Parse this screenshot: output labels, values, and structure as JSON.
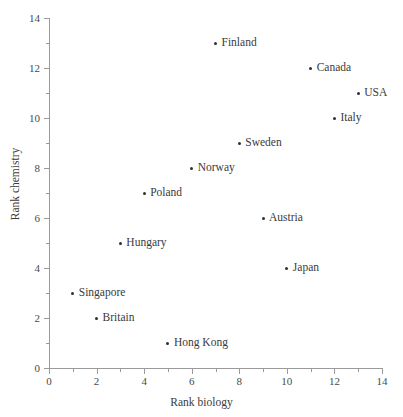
{
  "chart_data": {
    "type": "scatter",
    "title": "",
    "xlabel": "Rank biology",
    "ylabel": "Rank chemistry",
    "xlim": [
      0,
      14
    ],
    "ylim": [
      0,
      14
    ],
    "grid": false,
    "legend": "none",
    "x_ticks": [
      0,
      2,
      4,
      6,
      8,
      10,
      12,
      14
    ],
    "y_ticks": [
      0,
      2,
      4,
      6,
      8,
      10,
      12,
      14
    ],
    "x_minor_ticks": [
      1,
      3,
      5,
      7,
      9,
      11,
      13
    ],
    "y_minor_ticks": [
      1,
      3,
      5,
      7,
      9,
      11,
      13
    ],
    "x_tick_labels": [
      "0",
      "2",
      "4",
      "6",
      "8",
      "10",
      "12",
      "14"
    ],
    "y_tick_labels": [
      "0",
      "2",
      "4",
      "6",
      "8",
      "10",
      "12",
      "14"
    ],
    "marker_color": "#2f2f2f",
    "axis_color": "#9a9a9a",
    "points": [
      {
        "label": "Finland",
        "x": 7,
        "y": 13
      },
      {
        "label": "Canada",
        "x": 11,
        "y": 12
      },
      {
        "label": "USA",
        "x": 13,
        "y": 11
      },
      {
        "label": "Italy",
        "x": 12,
        "y": 10
      },
      {
        "label": "Sweden",
        "x": 8,
        "y": 9
      },
      {
        "label": "Norway",
        "x": 6,
        "y": 8
      },
      {
        "label": "Poland",
        "x": 4,
        "y": 7
      },
      {
        "label": "Austria",
        "x": 9,
        "y": 6
      },
      {
        "label": "Hungary",
        "x": 3,
        "y": 5
      },
      {
        "label": "Japan",
        "x": 10,
        "y": 4
      },
      {
        "label": "Singapore",
        "x": 1,
        "y": 3
      },
      {
        "label": "Britain",
        "x": 2,
        "y": 2
      },
      {
        "label": "Hong Kong",
        "x": 5,
        "y": 1
      }
    ]
  }
}
